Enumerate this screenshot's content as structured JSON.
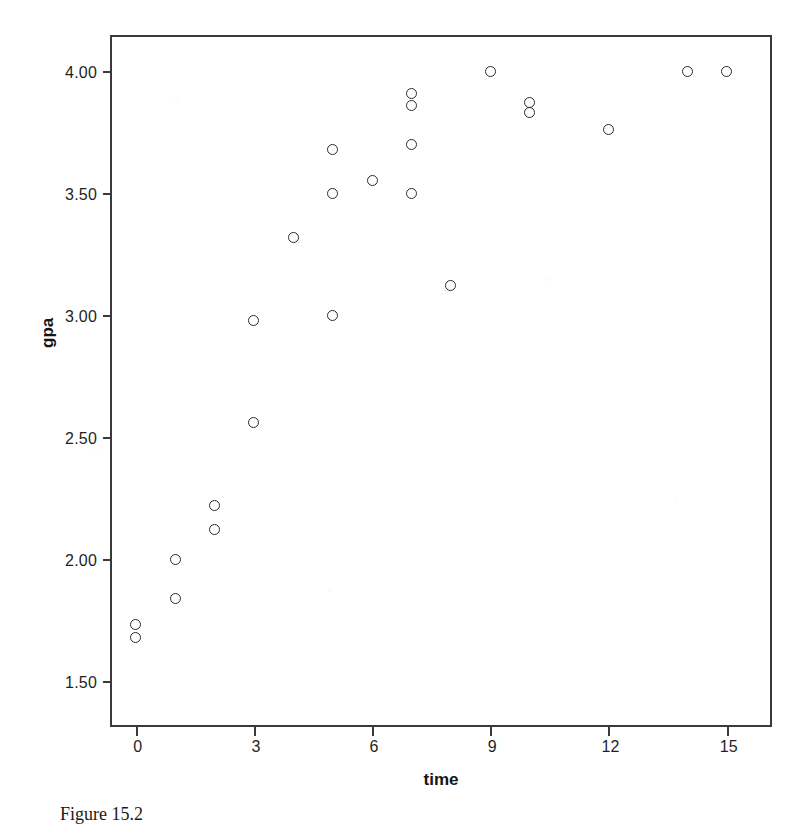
{
  "figure": {
    "caption": "Figure 15.2",
    "background_color": "#ffffff",
    "frame_color": "#3a3a3a",
    "marker_color": "#2b2b2b"
  },
  "chart_data": {
    "type": "scatter",
    "title": "",
    "xlabel": "time",
    "ylabel": "gpa",
    "xlim": [
      -0.6,
      16.1
    ],
    "ylim": [
      1.32,
      4.14
    ],
    "grid": false,
    "legend": null,
    "xticks": [
      0,
      3,
      6,
      9,
      12,
      15
    ],
    "xtick_labels": [
      "0",
      "3",
      "6",
      "9",
      "12",
      "15"
    ],
    "yticks": [
      1.5,
      2.0,
      2.5,
      3.0,
      3.5,
      4.0
    ],
    "ytick_labels": [
      "1.50",
      "2.00",
      "2.50",
      "3.00",
      "3.50",
      "4.00"
    ],
    "marker_style": "open-circle",
    "n_points": 24,
    "x": [
      0,
      0,
      1,
      1,
      2,
      2,
      3,
      3,
      4,
      5,
      5,
      5,
      6,
      7,
      7,
      7,
      7,
      8,
      9,
      10,
      10,
      12,
      14,
      15
    ],
    "y": [
      1.73,
      1.68,
      2.0,
      1.84,
      2.22,
      2.12,
      2.98,
      2.56,
      3.32,
      3.68,
      3.5,
      3.0,
      3.55,
      3.91,
      3.86,
      3.7,
      3.5,
      3.12,
      4.0,
      3.87,
      3.83,
      3.76,
      4.0,
      4.0
    ],
    "points": [
      {
        "time": 0,
        "gpa": 1.73
      },
      {
        "time": 0,
        "gpa": 1.68
      },
      {
        "time": 1,
        "gpa": 2.0
      },
      {
        "time": 1,
        "gpa": 1.84
      },
      {
        "time": 2,
        "gpa": 2.22
      },
      {
        "time": 2,
        "gpa": 2.12
      },
      {
        "time": 3,
        "gpa": 2.98
      },
      {
        "time": 3,
        "gpa": 2.56
      },
      {
        "time": 4,
        "gpa": 3.32
      },
      {
        "time": 5,
        "gpa": 3.68
      },
      {
        "time": 5,
        "gpa": 3.5
      },
      {
        "time": 5,
        "gpa": 3.0
      },
      {
        "time": 6,
        "gpa": 3.55
      },
      {
        "time": 7,
        "gpa": 3.91
      },
      {
        "time": 7,
        "gpa": 3.86
      },
      {
        "time": 7,
        "gpa": 3.7
      },
      {
        "time": 7,
        "gpa": 3.5
      },
      {
        "time": 8,
        "gpa": 3.12
      },
      {
        "time": 9,
        "gpa": 4.0
      },
      {
        "time": 10,
        "gpa": 3.87
      },
      {
        "time": 10,
        "gpa": 3.83
      },
      {
        "time": 12,
        "gpa": 3.76
      },
      {
        "time": 14,
        "gpa": 4.0
      },
      {
        "time": 15,
        "gpa": 4.0
      }
    ]
  }
}
